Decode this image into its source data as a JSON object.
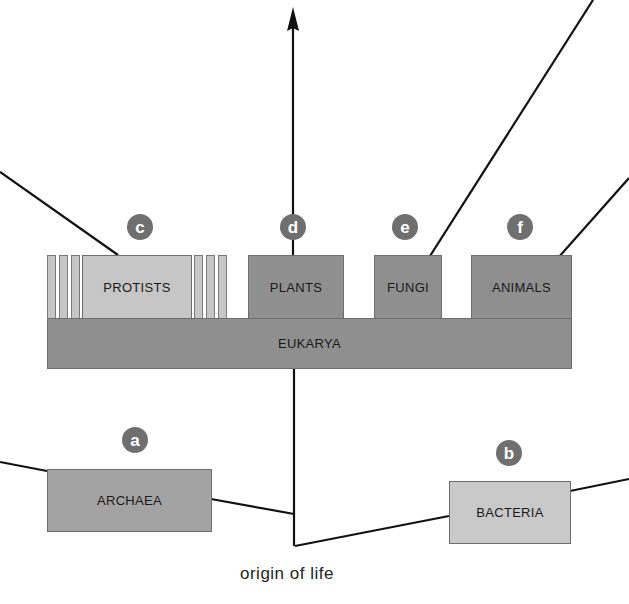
{
  "diagram": {
    "root_label": "origin of life",
    "domains": {
      "eukarya": {
        "label": "EUKARYA"
      },
      "archaea": {
        "label": "ARCHAEA",
        "badge": "a"
      },
      "bacteria": {
        "label": "BACTERIA",
        "badge": "b"
      }
    },
    "kingdoms": [
      {
        "label": "PROTISTS",
        "badge": "c"
      },
      {
        "label": "PLANTS",
        "badge": "d"
      },
      {
        "label": "FUNGI",
        "badge": "e"
      },
      {
        "label": "ANIMALS",
        "badge": "f"
      }
    ],
    "icons": [
      "arrow-up-icon"
    ],
    "colors": {
      "background": "#ffffff",
      "eukarya_fill": "#8f8f8f",
      "kingdom_fill": "#8f8f8f",
      "protist_fill": "#c6c6c6",
      "prokaryote_fill": "#b4b4b4",
      "badge_fill": "#6f6f6f",
      "line": "#111111"
    }
  }
}
